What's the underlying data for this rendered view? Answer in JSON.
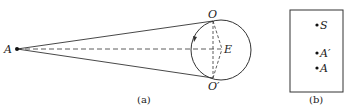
{
  "figure_a": {
    "caption": "(a)",
    "labels": {
      "A": "A",
      "O": "O",
      "O_prime": "O′",
      "E": "E"
    }
  },
  "figure_b": {
    "caption": "(b)",
    "labels": {
      "S": "S",
      "A_prime": "A′",
      "A": "A"
    }
  }
}
